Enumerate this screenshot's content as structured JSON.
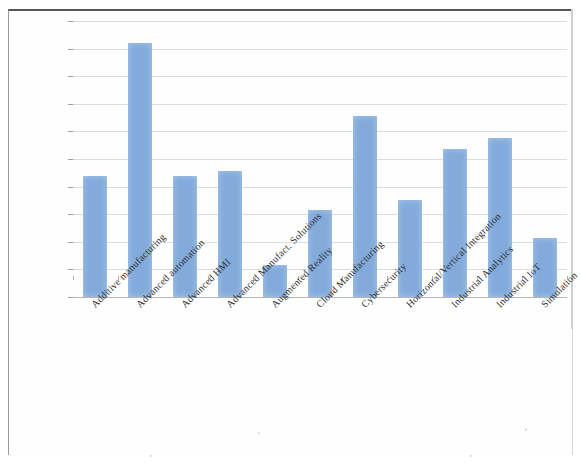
{
  "chart_data": {
    "type": "bar",
    "title": "",
    "subtitle": "",
    "xlabel": "",
    "ylabel": "",
    "ylim": [
      0,
      20
    ],
    "ytick_labels": [
      "20%",
      "18%",
      "16%",
      "14%",
      "12%",
      "10%",
      "8%",
      "6%",
      "4%",
      "2%",
      "0%"
    ],
    "ytick_values": [
      20,
      18,
      16,
      14,
      12,
      10,
      8,
      6,
      4,
      2,
      0
    ],
    "grid": true,
    "legend": "none",
    "value_suffix": "%",
    "bar_color": "#82abdc",
    "categories": [
      "Additive manufacturing",
      "Advanced automation",
      "Advanced HMI",
      "Advanced Manufact. Solutions",
      "Augmented Reality",
      "Cloud Manufacturing",
      "Cybersecurity",
      "Horizontal/Vertical Integration",
      "Industrial Analytics",
      "Industrial IoT",
      "Simulation"
    ],
    "values": [
      8.8,
      18.4,
      8.8,
      9.1,
      2.3,
      6.3,
      13.1,
      7.0,
      10.7,
      11.5,
      4.3
    ]
  }
}
